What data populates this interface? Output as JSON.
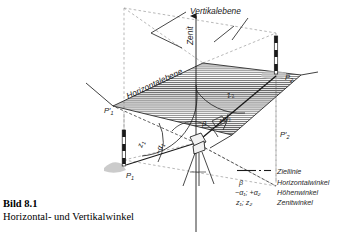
{
  "figure": {
    "caption_title": "Bild 8.1",
    "caption_subtitle": "Horizontal- und Vertikalwinkel",
    "plane_labels": {
      "vertical_plane": "Vertikalebene",
      "horizontal_plane": "Horizontalebene",
      "zenith": "Zenit"
    },
    "point_labels": {
      "p1": "P",
      "p1_sub": "1",
      "p1_proj": "P'",
      "p1_proj_sub": "1",
      "p2": "P",
      "p2_sub": "2",
      "p2_proj": "P'",
      "p2_proj_sub": "2"
    },
    "angle_labels": {
      "beta": "β",
      "z1": "z",
      "z1_sub": "1",
      "z2": "z",
      "z2_sub": "2",
      "alpha1": "−α",
      "alpha1_sub": "1",
      "alpha2": "+α",
      "alpha2_sub": "2"
    },
    "colors": {
      "ink": "#1a1a1a",
      "hatch": "#3c3c3c",
      "dashed": "#8a8a8a",
      "shadow": "#b9b9b9",
      "paper": "#ffffff"
    }
  },
  "legend": {
    "rows": [
      {
        "symbol": "",
        "icon": "line-dashdot-icon",
        "label": "Ziellinie"
      },
      {
        "symbol": "β",
        "icon": "",
        "label": "Horizontalwinkel"
      },
      {
        "symbol": "−α₁; +α₂",
        "icon": "",
        "label": "Höhenwinkel"
      },
      {
        "symbol": "z₁; z₂",
        "icon": "",
        "label": "Zenitwinkel"
      }
    ]
  }
}
